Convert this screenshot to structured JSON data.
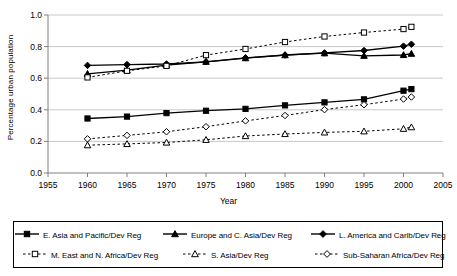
{
  "chart_data": {
    "type": "line",
    "title": "",
    "xlabel": "Year",
    "ylabel": "Percentage urban population",
    "xlim": [
      1955,
      2005
    ],
    "ylim": [
      0.0,
      1.0
    ],
    "xticks": [
      1955,
      1960,
      1965,
      1970,
      1975,
      1980,
      1985,
      1990,
      1995,
      2000,
      2005
    ],
    "yticks": [
      "0.0",
      "0.2",
      "0.4",
      "0.6",
      "0.8",
      "1.0"
    ],
    "grid": "horizontal",
    "legend_position": "bottom",
    "x": [
      1960,
      1965,
      1970,
      1975,
      1980,
      1985,
      1990,
      1995,
      2000,
      2001
    ],
    "series": [
      {
        "name": "E. Asia and Pacific/Dev Reg",
        "marker": "filled-square",
        "line": "solid",
        "values": [
          0.345,
          0.357,
          0.379,
          0.394,
          0.406,
          0.428,
          0.447,
          0.466,
          0.521,
          0.531
        ]
      },
      {
        "name": "Europe and C. Asia/Dev Reg",
        "marker": "filled-triangle",
        "line": "solid",
        "values": [
          0.628,
          0.651,
          0.683,
          0.704,
          0.727,
          0.746,
          0.758,
          0.742,
          0.747,
          0.755
        ]
      },
      {
        "name": "L. America and Carib/Dev Reg",
        "marker": "filled-diamond",
        "line": "solid",
        "values": [
          0.681,
          0.686,
          0.69,
          0.704,
          0.729,
          0.747,
          0.76,
          0.775,
          0.803,
          0.815
        ]
      },
      {
        "name": "M. East and N. Africa/Dev Reg",
        "marker": "open-square",
        "line": "dashed",
        "values": [
          0.605,
          0.647,
          0.678,
          0.746,
          0.785,
          0.829,
          0.864,
          0.889,
          0.911,
          0.925
        ]
      },
      {
        "name": "S. Asia/Dev Reg",
        "marker": "open-triangle",
        "line": "dashed",
        "values": [
          0.176,
          0.184,
          0.193,
          0.21,
          0.234,
          0.247,
          0.257,
          0.264,
          0.28,
          0.29
        ]
      },
      {
        "name": "Sub-Saharan Africa/Dev Reg",
        "marker": "open-diamond",
        "line": "dashed",
        "values": [
          0.216,
          0.238,
          0.261,
          0.293,
          0.33,
          0.364,
          0.401,
          0.432,
          0.468,
          0.481
        ]
      }
    ]
  },
  "axes": {
    "ylabel": "Percentage urban population",
    "xlabel": "Year"
  },
  "legend": {
    "row1": [
      {
        "label": "E. Asia and Pacific/Dev Reg",
        "marker": "filled-square",
        "line": "solid"
      },
      {
        "label": "Europe and C. Asia/Dev Reg",
        "marker": "filled-triangle",
        "line": "solid"
      },
      {
        "label": "L. America and Carib/Dev Reg",
        "marker": "filled-diamond",
        "line": "solid"
      }
    ],
    "row2": [
      {
        "label": "M. East and N. Africa/Dev Reg",
        "marker": "open-square",
        "line": "dashed"
      },
      {
        "label": "S. Asia/Dev Reg",
        "marker": "open-triangle",
        "line": "dashed"
      },
      {
        "label": "Sub-Saharan Africa/Dev Reg",
        "marker": "open-diamond",
        "line": "dashed"
      }
    ]
  },
  "colors": {
    "line": "#000000",
    "grid": "#c8c8c8",
    "axis": "#808080",
    "background": "#ffffff"
  }
}
